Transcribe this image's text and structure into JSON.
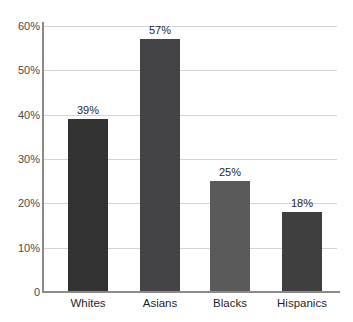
{
  "chart_data": {
    "type": "bar",
    "title": "",
    "subtitle": "",
    "xlabel": "",
    "ylabel": "",
    "categories": [
      "Whites",
      "Asians",
      "Blacks",
      "Hispanics"
    ],
    "values": [
      39,
      57,
      25,
      18
    ],
    "data_labels": [
      "39%",
      "57%",
      "25%",
      "18%"
    ],
    "bar_colors": [
      "#333333",
      "#444446",
      "#5a5a5a",
      "#3f3f3f"
    ],
    "ylim": [
      0,
      60
    ],
    "ytick_values": [
      0,
      10,
      20,
      30,
      40,
      50,
      60
    ],
    "ytick_labels": [
      "0",
      "10%",
      "20%",
      "30%",
      "40%",
      "50%",
      "60%"
    ],
    "grid": true,
    "grid_axis": "y",
    "legend": false,
    "legend_position": "none",
    "background_color": "#ffffff",
    "gridline_color": "#d4d4d4",
    "axis_color": "#8a8a8a",
    "label_color": "#1f1f1f",
    "tick_color": "#4a4a4a"
  }
}
